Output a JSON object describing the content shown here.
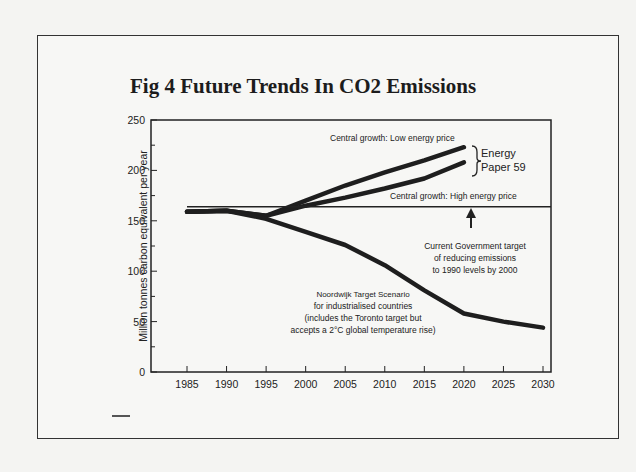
{
  "chart_data": {
    "type": "line",
    "title": "Fig 4  Future Trends In CO2 Emissions",
    "xlabel": "",
    "ylabel": "Million tonnes carbon equivalent per year",
    "xlim": [
      1985,
      2030
    ],
    "ylim": [
      0,
      250
    ],
    "x_ticks": [
      "1985",
      "1990",
      "1995",
      "2000",
      "2005",
      "2010",
      "2015",
      "2020",
      "2025",
      "2030"
    ],
    "y_ticks": [
      "0",
      "50",
      "100",
      "150",
      "200",
      "250"
    ],
    "grid": false,
    "series": [
      {
        "name": "Central growth: Low energy price",
        "x": [
          1985,
          1990,
          1995,
          2000,
          2005,
          2010,
          2015,
          2020
        ],
        "values": [
          159,
          160,
          155,
          170,
          185,
          198,
          210,
          223
        ]
      },
      {
        "name": "Central growth: High energy price",
        "x": [
          1985,
          1990,
          1995,
          2000,
          2005,
          2010,
          2015,
          2020
        ],
        "values": [
          159,
          160,
          155,
          165,
          173,
          182,
          192,
          208
        ]
      },
      {
        "name": "Target Scenario for industrialised countries",
        "x": [
          1985,
          1990,
          1995,
          2000,
          2005,
          2010,
          2015,
          2020,
          2025,
          2030
        ],
        "values": [
          159,
          160,
          152,
          139,
          126,
          106,
          81,
          58,
          50,
          44
        ]
      },
      {
        "name": "Current Government target",
        "x": [
          1985,
          2030
        ],
        "values": [
          164,
          164
        ]
      }
    ],
    "annotations": {
      "low_price": "Central growth: Low energy price",
      "high_price": "Central growth: High energy price",
      "energy_paper_1": "Energy",
      "energy_paper_2": "Paper 59",
      "gov_target_1": "Current Government target",
      "gov_target_2": "of reducing emissions",
      "gov_target_3": "to 1990 levels by 2000",
      "scenario_1": "Noordwijk Target Scenario",
      "scenario_2": "for industrialised countries",
      "scenario_3": "(includes the Toronto target but",
      "scenario_4": "accepts a 2°C global temperature rise)"
    }
  }
}
